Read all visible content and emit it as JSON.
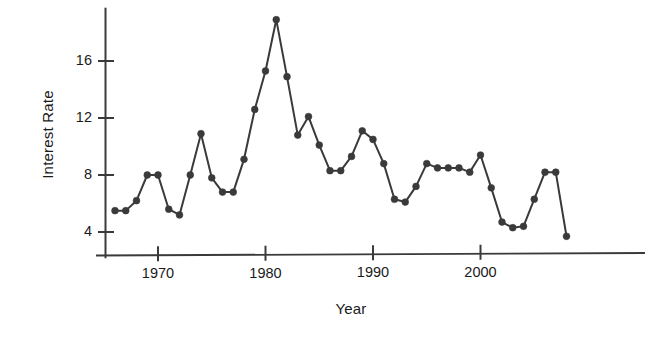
{
  "chart_data": {
    "type": "line",
    "title": "",
    "xlabel": "Year",
    "ylabel": "Interest Rate",
    "grid": false,
    "legend": false,
    "marker": "filled-circle",
    "line_color": "#3a3a3a",
    "marker_color": "#3a3a3a",
    "axis_color": "#3a3a3a",
    "background": "#ffffff",
    "xlim": [
      1965.3,
      2008.8
    ],
    "ylim": [
      3.0,
      19.6
    ],
    "xticks": [
      1970,
      1980,
      1990,
      2000
    ],
    "xtick_labels": [
      "1970",
      "1980",
      "1990",
      "2000"
    ],
    "yticks": [
      4,
      8,
      12,
      16
    ],
    "ytick_labels": [
      "4",
      "8",
      "12",
      "16"
    ],
    "x": [
      1966,
      1967,
      1968,
      1969,
      1970,
      1971,
      1972,
      1973,
      1974,
      1975,
      1976,
      1977,
      1978,
      1979,
      1980,
      1981,
      1982,
      1983,
      1984,
      1985,
      1986,
      1987,
      1988,
      1989,
      1990,
      1991,
      1992,
      1993,
      1994,
      1995,
      1996,
      1997,
      1998,
      1999,
      2000,
      2001,
      2002,
      2003,
      2004,
      2005,
      2006,
      2007,
      2008
    ],
    "values": [
      5.5,
      5.5,
      6.2,
      8.0,
      8.0,
      5.6,
      5.2,
      8.0,
      10.9,
      7.8,
      6.8,
      6.8,
      9.1,
      12.6,
      15.3,
      18.9,
      14.9,
      10.8,
      12.1,
      10.1,
      8.3,
      8.3,
      9.3,
      11.1,
      10.5,
      8.8,
      6.3,
      6.1,
      7.2,
      8.8,
      8.5,
      8.5,
      8.5,
      8.2,
      9.4,
      7.1,
      4.7,
      4.3,
      4.4,
      6.3,
      8.2,
      8.2,
      3.7
    ],
    "series_name": "Interest Rate"
  },
  "axes": {
    "y_title": "Interest Rate",
    "x_title": "Year"
  }
}
